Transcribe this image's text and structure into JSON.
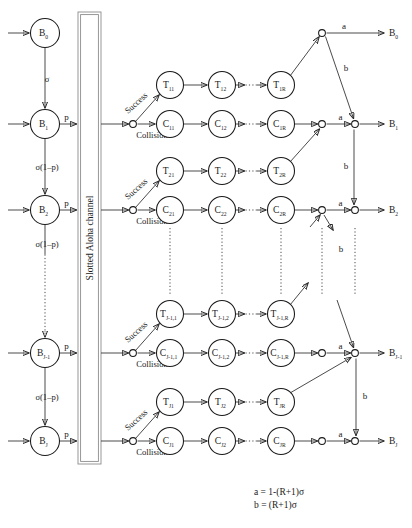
{
  "diagram": {
    "channel_label": "Slotted Aloha channel",
    "branch_labels": {
      "success": "Success",
      "collision": "Collision"
    },
    "edge_labels": {
      "sigma": "σ",
      "p": "p",
      "sigma_1mp": "σ(1–p)",
      "a": "a",
      "b": "b"
    },
    "legend": [
      "a = 1-(R+1)σ",
      "b = (R+1)σ"
    ],
    "buffer_nodes": [
      {
        "base": "B",
        "sub": "0",
        "y": 33
      },
      {
        "base": "B",
        "sub": "1",
        "y": 124
      },
      {
        "base": "B",
        "sub": "2",
        "y": 210
      },
      {
        "base": "B",
        "sub": "J-1",
        "y": 353
      },
      {
        "base": "B",
        "sub": "J",
        "y": 441
      }
    ],
    "output_nodes": [
      {
        "base": "B",
        "sub": "0",
        "y": 33
      },
      {
        "base": "B",
        "sub": "1",
        "y": 124
      },
      {
        "base": "B",
        "sub": "2",
        "y": 210
      },
      {
        "base": "B",
        "sub": "J-1",
        "y": 353
      },
      {
        "base": "B",
        "sub": "J",
        "y": 441
      }
    ],
    "rows": [
      {
        "index": 1,
        "t_y": 85,
        "c_y": 124,
        "merge_y": 124,
        "t_nodes": [
          {
            "base": "T",
            "sub": "11"
          },
          {
            "base": "T",
            "sub": "12"
          },
          {
            "base": "T",
            "sub": "1R"
          }
        ],
        "c_nodes": [
          {
            "base": "C",
            "sub": "11"
          },
          {
            "base": "C",
            "sub": "12"
          },
          {
            "base": "C",
            "sub": "1R"
          }
        ]
      },
      {
        "index": 2,
        "t_y": 171,
        "c_y": 210,
        "merge_y": 210,
        "t_nodes": [
          {
            "base": "T",
            "sub": "21"
          },
          {
            "base": "T",
            "sub": "22"
          },
          {
            "base": "T",
            "sub": "2R"
          }
        ],
        "c_nodes": [
          {
            "base": "C",
            "sub": "21"
          },
          {
            "base": "C",
            "sub": "22"
          },
          {
            "base": "C",
            "sub": "2R"
          }
        ]
      },
      {
        "index": 3,
        "t_y": 314,
        "c_y": 353,
        "merge_y": 353,
        "t_nodes": [
          {
            "base": "T",
            "sub": "J-1,1"
          },
          {
            "base": "T",
            "sub": "J-1,2"
          },
          {
            "base": "T",
            "sub": "J-1,R"
          }
        ],
        "c_nodes": [
          {
            "base": "C",
            "sub": "J-1,1"
          },
          {
            "base": "C",
            "sub": "J-1,2"
          },
          {
            "base": "C",
            "sub": "J-1,R"
          }
        ]
      },
      {
        "index": 4,
        "t_y": 402,
        "c_y": 441,
        "merge_y": 441,
        "t_nodes": [
          {
            "base": "T",
            "sub": "J1"
          },
          {
            "base": "T",
            "sub": "J2"
          },
          {
            "base": "T",
            "sub": "JR"
          }
        ],
        "c_nodes": [
          {
            "base": "C",
            "sub": "J1"
          },
          {
            "base": "C",
            "sub": "J2"
          },
          {
            "base": "C",
            "sub": "JR"
          }
        ]
      }
    ]
  }
}
